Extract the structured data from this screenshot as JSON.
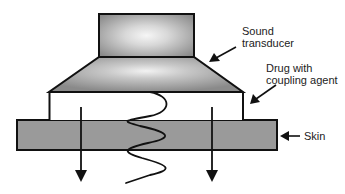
{
  "diagram": {
    "labels": {
      "transducer_line1": "Sound",
      "transducer_line2": "transducer",
      "drug_line1": "Drug with",
      "drug_line2": "coupling agent",
      "skin": "Skin"
    },
    "colors": {
      "stroke": "#111111",
      "transducer_fill_edge": "#8c8c8c",
      "transducer_fill_center": "#f4f4f4",
      "skin_fill": "#9a9a9a",
      "drug_fill": "#ffffff",
      "background": "#ffffff"
    },
    "components": [
      {
        "id": "transducer-head",
        "shape": "rectangle",
        "x": 99,
        "y": 14,
        "w": 95,
        "h": 43
      },
      {
        "id": "transducer-horn",
        "shape": "trapezoid",
        "top_left": 99,
        "top_right": 194,
        "top_y": 57,
        "bottom_left": 49,
        "bottom_right": 243,
        "bottom_y": 92
      },
      {
        "id": "drug-layer",
        "shape": "rectangle",
        "x": 49,
        "y": 92,
        "w": 194,
        "h": 28
      },
      {
        "id": "skin-layer",
        "shape": "rectangle",
        "x": 17,
        "y": 120,
        "w": 260,
        "h": 30
      }
    ]
  }
}
